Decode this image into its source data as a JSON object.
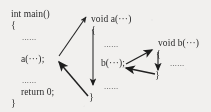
{
  "figure": {
    "background_color": "#f7f6f4",
    "ink_color": "#232323",
    "ellipsis": "......"
  },
  "blocks": {
    "main": {
      "signature": "int main()",
      "open_brace": "{",
      "body_ellipsis_1": "......",
      "call_a": "a(···);",
      "body_ellipsis_2": "......",
      "return_statement": "return 0;",
      "close_brace": "}"
    },
    "func_a": {
      "signature": "void a(···)",
      "open_brace": "{",
      "body_ellipsis_1": "......",
      "call_b": "b(···);",
      "body_ellipsis_2": "......",
      "close_brace": "}"
    },
    "func_b": {
      "signature": "void b(···)",
      "open_brace": "{",
      "body_ellipsis_1": "......",
      "close_brace": "}"
    }
  },
  "arrows": {
    "call_main_to_a": "call a from main",
    "flow_through_a": "execute body of a",
    "return_a_to_main": "return from a to main",
    "call_a_to_b": "call b from a",
    "flow_through_b": "execute body of b",
    "return_b_to_a": "return from b to a"
  }
}
